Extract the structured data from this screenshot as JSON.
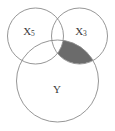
{
  "figure": {
    "type": "venn-diagram",
    "title": "",
    "background_color": "#ffffff",
    "outline_color": "#8a8a8a",
    "label_color": "#3a3a3a",
    "shaded_color": "#6b6b6b"
  },
  "sets": [
    {
      "id": "left",
      "label_base": "X",
      "label_sub": "5",
      "label_full": "X5",
      "center_x": 35.5,
      "center_y": 36,
      "radius": 28,
      "label_x": 29,
      "label_y": 32
    },
    {
      "id": "right",
      "label_base": "X",
      "label_sub": "3",
      "label_full": "X3",
      "center_x": 79.5,
      "center_y": 36,
      "radius": 28,
      "label_x": 81,
      "label_y": 32
    },
    {
      "id": "bottom",
      "label_base": "Y",
      "label_sub": "",
      "label_full": "Y",
      "center_x": 57.5,
      "center_y": 81,
      "radius": 41,
      "label_x": 57,
      "label_y": 90
    }
  ],
  "regions": [
    {
      "id": "right-and-bottom-not-left",
      "description": "intersection of X3 and Y excluding X5",
      "fill": "#6b6b6b",
      "shaded": true
    }
  ]
}
